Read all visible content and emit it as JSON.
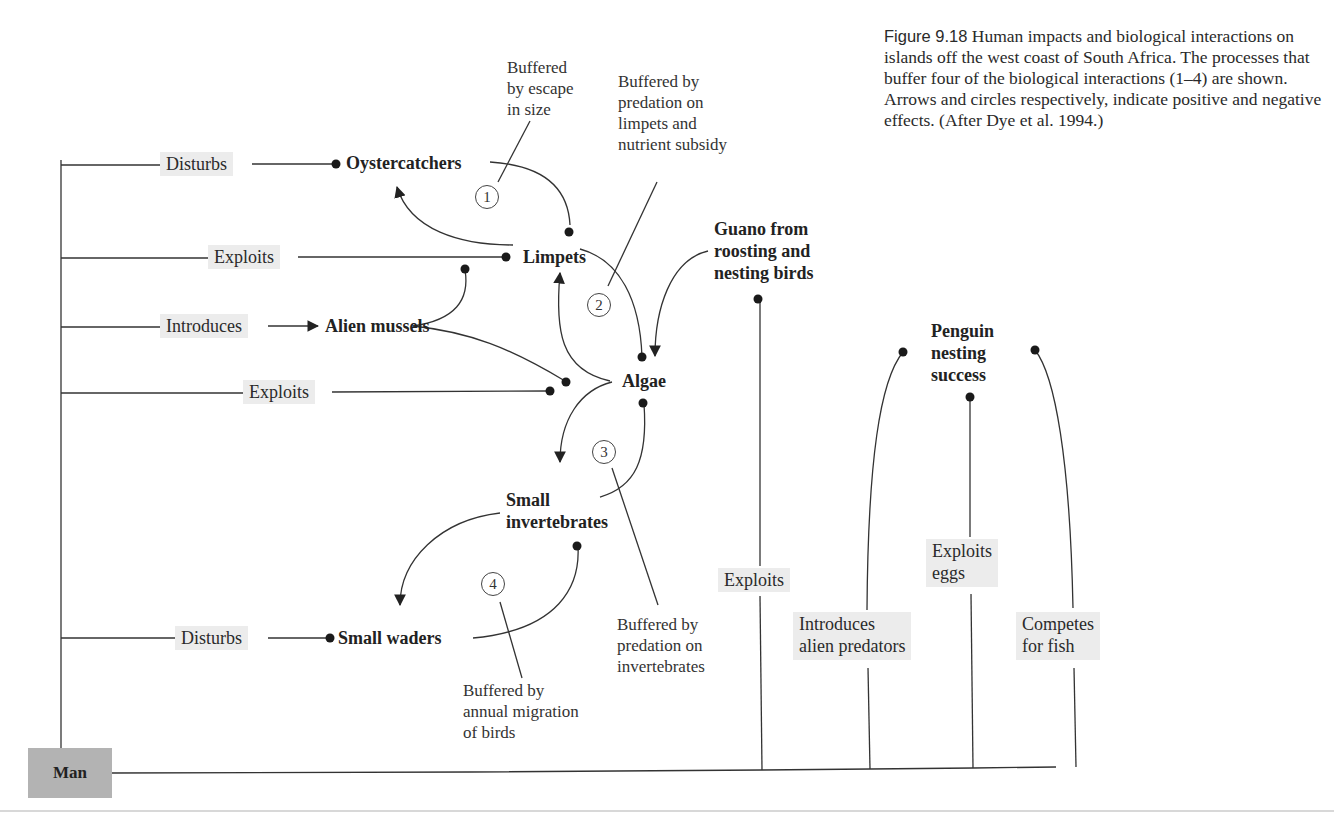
{
  "caption": {
    "figure_label": "Figure 9.18",
    "text": "Human impacts and biological interactions on islands off the west coast of South Africa. The processes that buffer four of the biological interactions (1–4) are shown. Arrows and circles respectively, indicate positive and negative effects. (After Dye et al. 1994.)"
  },
  "nodes": {
    "man": "Man",
    "oystercatchers": "Oystercatchers",
    "limpets": "Limpets",
    "alien_mussels": "Alien mussels",
    "algae": "Algae",
    "small_invertebrates_1": "Small",
    "small_invertebrates_2": "invertebrates",
    "small_waders": "Small waders",
    "guano_1": "Guano from",
    "guano_2": "roosting and",
    "guano_3": "nesting birds",
    "penguin_1": "Penguin",
    "penguin_2": "nesting",
    "penguin_3": "success"
  },
  "actions": {
    "disturbs_oystercatchers": "Disturbs",
    "exploits_limpets": "Exploits",
    "introduces_mussels": "Introduces",
    "exploits_algae": "Exploits",
    "disturbs_waders": "Disturbs",
    "exploits_guano": "Exploits",
    "introduces_predators_1": "Introduces",
    "introduces_predators_2": "alien predators",
    "exploits_eggs_1": "Exploits",
    "exploits_eggs_2": "eggs",
    "competes_1": "Competes",
    "competes_2": "for fish"
  },
  "buffers": {
    "n1": "1",
    "n2": "2",
    "n3": "3",
    "n4": "4",
    "b1": "Buffered\nby escape\nin size",
    "b2": "Buffered by\npredation on\nlimpets and\nnutrient subsidy",
    "b3": "Buffered by\npredation on\ninvertebrates",
    "b4": "Buffered by\nannual migration\nof birds"
  },
  "legend": {
    "positive_effect": "arrow",
    "negative_effect": "filled-circle"
  },
  "colors": {
    "line": "#333333",
    "action_box": "#ececec",
    "man_box": "#b3b3b3",
    "text": "#222222"
  }
}
